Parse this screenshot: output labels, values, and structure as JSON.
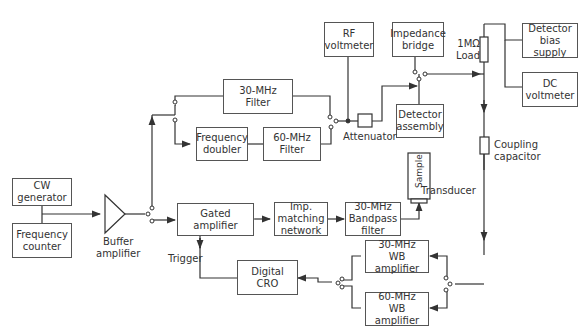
{
  "diagram": {
    "type": "block-diagram",
    "blocks": {
      "cw_generator": [
        "CW",
        "generator"
      ],
      "frequency_counter": [
        "Frequency",
        "counter"
      ],
      "filter_30": [
        "30-MHz",
        "Filter"
      ],
      "frequency_doubler": [
        "Frequency",
        "doubler"
      ],
      "filter_60": [
        "60-MHz",
        "Filter"
      ],
      "gated_amplifier": [
        "Gated",
        "amplifier"
      ],
      "imp_matching": [
        "Imp.",
        "matching",
        "network"
      ],
      "bandpass_30": [
        "30-MHz",
        "Bandpass",
        "filter"
      ],
      "rf_voltmeter": [
        "RF",
        "voltmeter"
      ],
      "impedance_bridge": [
        "Impedance",
        "bridge"
      ],
      "detector_assembly": [
        "Detector",
        "assembly"
      ],
      "detector_bias_supply": [
        "Detector",
        "bias supply"
      ],
      "dc_voltmeter": [
        "DC",
        "voltmeter"
      ],
      "wb_amp_30": [
        "30-MHz",
        "WB amplifier"
      ],
      "wb_amp_60": [
        "60-MHz",
        "WB amplifier"
      ],
      "digital_cro": [
        "Digital",
        "CRO"
      ]
    },
    "labels": {
      "buffer_amplifier": [
        "Buffer",
        "amplifier"
      ],
      "attenuator": "Attenuator",
      "load": [
        "1MΩ",
        "Load"
      ],
      "coupling_capacitor": [
        "Coupling",
        "capacitor"
      ],
      "sample": "Sample",
      "transducer": "Transducer",
      "trigger": "Trigger"
    }
  }
}
